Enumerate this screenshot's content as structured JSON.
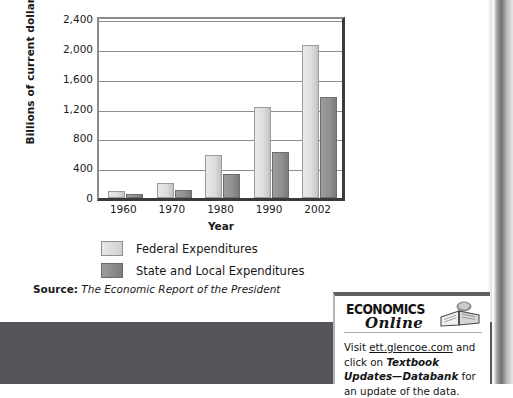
{
  "chart_data": {
    "type": "bar",
    "title": "",
    "xlabel": "Year",
    "ylabel": "Billions of current dollars",
    "categories": [
      "1960",
      "1970",
      "1980",
      "1990",
      "2002"
    ],
    "series": [
      {
        "name": "Federal Expenditures",
        "color": "#dedede",
        "values": [
          90,
          195,
          580,
          1215,
          2050
        ]
      },
      {
        "name": "State and Local Expenditures",
        "color": "#919191",
        "values": [
          50,
          110,
          320,
          615,
          1350
        ]
      }
    ],
    "ylim": [
      0,
      2400
    ],
    "yticks": [
      "0",
      "400",
      "800",
      "1,200",
      "1,600",
      "2,000",
      "2,400"
    ],
    "ytick_values": [
      0,
      400,
      800,
      1200,
      1600,
      2000,
      2400
    ],
    "grid": true,
    "legend_position": "below-axis-left"
  },
  "source": {
    "label": "Source:",
    "title": "The Economic Report of the President"
  },
  "economics_online": {
    "wordmark": "ECONOMICS",
    "script": "Online",
    "book_icon": "open-book-icon",
    "body_prefix": "Visit ",
    "link": "ett.glencoe.com",
    "body_middle": " and click on ",
    "emphasis": "Textbook Updates—Databank",
    "body_suffix": " for an update of the data."
  }
}
